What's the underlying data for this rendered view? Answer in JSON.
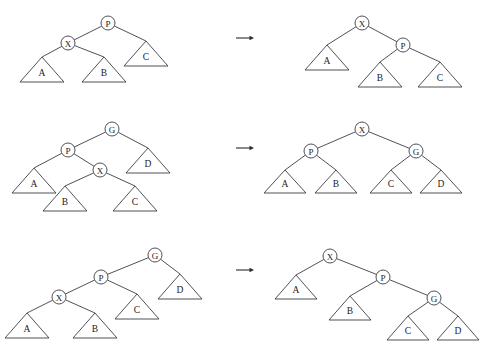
{
  "figure": {
    "width": 485,
    "height": 348,
    "background_color": "#ffffff",
    "stroke_color": "#3d3d46",
    "text_color": "#1c1c22",
    "node_radius": 7,
    "node_labels": [
      "P",
      "X",
      "G",
      "A",
      "B",
      "C",
      "D"
    ],
    "arrow_glyph": "→"
  },
  "rows": [
    {
      "name": "row-1-single-rotation",
      "arrow": {
        "x1": 236,
        "y1": 38,
        "x2": 254,
        "y2": 38,
        "label": "→"
      },
      "before": {
        "name": "row-1-before-tree",
        "nodes": [
          {
            "id": "P",
            "label": "P",
            "cx": 108,
            "cy": 23
          },
          {
            "id": "X",
            "label": "X",
            "cx": 68,
            "cy": 43
          }
        ],
        "triangles": [
          {
            "id": "A",
            "label": "A",
            "apex_x": 42,
            "apex_y": 57,
            "half_width": 22,
            "height": 25
          },
          {
            "id": "B",
            "label": "B",
            "apex_x": 104,
            "apex_y": 57,
            "half_width": 22,
            "height": 25
          },
          {
            "id": "C",
            "label": "C",
            "apex_x": 146,
            "apex_y": 41,
            "half_width": 22,
            "height": 25
          }
        ],
        "edges": [
          {
            "from": "P",
            "to": "X",
            "x1": 108,
            "y1": 23,
            "x2": 68,
            "y2": 43
          },
          {
            "from": "P",
            "to": "C",
            "x1": 108,
            "y1": 23,
            "x2": 146,
            "y2": 41
          },
          {
            "from": "X",
            "to": "A",
            "x1": 68,
            "y1": 43,
            "x2": 42,
            "y2": 57
          },
          {
            "from": "X",
            "to": "B",
            "x1": 68,
            "y1": 43,
            "x2": 104,
            "y2": 57
          }
        ]
      },
      "after": {
        "name": "row-1-after-tree",
        "nodes": [
          {
            "id": "X",
            "label": "X",
            "cx": 362,
            "cy": 23
          },
          {
            "id": "P",
            "label": "P",
            "cx": 403,
            "cy": 45
          }
        ],
        "triangles": [
          {
            "id": "A",
            "label": "A",
            "apex_x": 327,
            "apex_y": 45,
            "half_width": 22,
            "height": 25
          },
          {
            "id": "B",
            "label": "B",
            "apex_x": 380,
            "apex_y": 62,
            "half_width": 22,
            "height": 25
          },
          {
            "id": "C",
            "label": "C",
            "apex_x": 440,
            "apex_y": 62,
            "half_width": 22,
            "height": 25
          }
        ],
        "edges": [
          {
            "from": "X",
            "to": "A",
            "x1": 362,
            "y1": 23,
            "x2": 327,
            "y2": 45
          },
          {
            "from": "X",
            "to": "P",
            "x1": 362,
            "y1": 23,
            "x2": 403,
            "y2": 45
          },
          {
            "from": "P",
            "to": "B",
            "x1": 403,
            "y1": 45,
            "x2": 380,
            "y2": 62
          },
          {
            "from": "P",
            "to": "C",
            "x1": 403,
            "y1": 45,
            "x2": 440,
            "y2": 62
          }
        ]
      }
    },
    {
      "name": "row-2-double-rotation-left-right",
      "arrow": {
        "x1": 236,
        "y1": 148,
        "x2": 254,
        "y2": 148,
        "label": "→"
      },
      "before": {
        "name": "row-2-before-tree",
        "nodes": [
          {
            "id": "G",
            "label": "G",
            "cx": 112,
            "cy": 129
          },
          {
            "id": "P",
            "label": "P",
            "cx": 68,
            "cy": 150
          },
          {
            "id": "X",
            "label": "X",
            "cx": 100,
            "cy": 170
          }
        ],
        "triangles": [
          {
            "id": "A",
            "label": "A",
            "apex_x": 34,
            "apex_y": 168,
            "half_width": 22,
            "height": 25
          },
          {
            "id": "B",
            "label": "B",
            "apex_x": 65,
            "apex_y": 186,
            "half_width": 22,
            "height": 25
          },
          {
            "id": "C",
            "label": "C",
            "apex_x": 135,
            "apex_y": 186,
            "half_width": 22,
            "height": 25
          },
          {
            "id": "D",
            "label": "D",
            "apex_x": 148,
            "apex_y": 148,
            "half_width": 22,
            "height": 25
          }
        ],
        "edges": [
          {
            "from": "G",
            "to": "P",
            "x1": 112,
            "y1": 129,
            "x2": 68,
            "y2": 150
          },
          {
            "from": "G",
            "to": "D",
            "x1": 112,
            "y1": 129,
            "x2": 148,
            "y2": 148
          },
          {
            "from": "P",
            "to": "A",
            "x1": 68,
            "y1": 150,
            "x2": 34,
            "y2": 168
          },
          {
            "from": "P",
            "to": "X",
            "x1": 68,
            "y1": 150,
            "x2": 100,
            "y2": 170
          },
          {
            "from": "X",
            "to": "B",
            "x1": 100,
            "y1": 170,
            "x2": 65,
            "y2": 186
          },
          {
            "from": "X",
            "to": "C",
            "x1": 100,
            "y1": 170,
            "x2": 135,
            "y2": 186
          }
        ]
      },
      "after": {
        "name": "row-2-after-tree",
        "nodes": [
          {
            "id": "X",
            "label": "X",
            "cx": 362,
            "cy": 129
          },
          {
            "id": "P",
            "label": "P",
            "cx": 311,
            "cy": 151
          },
          {
            "id": "G",
            "label": "G",
            "cx": 416,
            "cy": 151
          }
        ],
        "triangles": [
          {
            "id": "A",
            "label": "A",
            "apex_x": 285,
            "apex_y": 170,
            "half_width": 21,
            "height": 23
          },
          {
            "id": "B",
            "label": "B",
            "apex_x": 336,
            "apex_y": 170,
            "half_width": 21,
            "height": 23
          },
          {
            "id": "C",
            "label": "C",
            "apex_x": 391,
            "apex_y": 170,
            "half_width": 21,
            "height": 23
          },
          {
            "id": "D",
            "label": "D",
            "apex_x": 441,
            "apex_y": 170,
            "half_width": 21,
            "height": 23
          }
        ],
        "edges": [
          {
            "from": "X",
            "to": "P",
            "x1": 362,
            "y1": 129,
            "x2": 311,
            "y2": 151
          },
          {
            "from": "X",
            "to": "G",
            "x1": 362,
            "y1": 129,
            "x2": 416,
            "y2": 151
          },
          {
            "from": "P",
            "to": "A",
            "x1": 311,
            "y1": 151,
            "x2": 285,
            "y2": 170
          },
          {
            "from": "P",
            "to": "B",
            "x1": 311,
            "y1": 151,
            "x2": 336,
            "y2": 170
          },
          {
            "from": "G",
            "to": "C",
            "x1": 416,
            "y1": 151,
            "x2": 391,
            "y2": 170
          },
          {
            "from": "G",
            "to": "D",
            "x1": 416,
            "y1": 151,
            "x2": 441,
            "y2": 170
          }
        ]
      }
    },
    {
      "name": "row-3-double-rotation-left-left",
      "arrow": {
        "x1": 236,
        "y1": 270,
        "x2": 254,
        "y2": 270,
        "label": "→"
      },
      "before": {
        "name": "row-3-before-tree",
        "nodes": [
          {
            "id": "G",
            "label": "G",
            "cx": 155,
            "cy": 255
          },
          {
            "id": "P",
            "label": "P",
            "cx": 101,
            "cy": 277
          },
          {
            "id": "X",
            "label": "X",
            "cx": 59,
            "cy": 297
          }
        ],
        "triangles": [
          {
            "id": "A",
            "label": "A",
            "apex_x": 27,
            "apex_y": 313,
            "half_width": 22,
            "height": 25
          },
          {
            "id": "B",
            "label": "B",
            "apex_x": 95,
            "apex_y": 313,
            "half_width": 22,
            "height": 25
          },
          {
            "id": "C",
            "label": "C",
            "apex_x": 137,
            "apex_y": 294,
            "half_width": 22,
            "height": 25
          },
          {
            "id": "D",
            "label": "D",
            "apex_x": 180,
            "apex_y": 274,
            "half_width": 22,
            "height": 25
          }
        ],
        "edges": [
          {
            "from": "G",
            "to": "P",
            "x1": 155,
            "y1": 255,
            "x2": 101,
            "y2": 277
          },
          {
            "from": "G",
            "to": "D",
            "x1": 155,
            "y1": 255,
            "x2": 180,
            "y2": 274
          },
          {
            "from": "P",
            "to": "X",
            "x1": 101,
            "y1": 277,
            "x2": 59,
            "y2": 297
          },
          {
            "from": "P",
            "to": "C",
            "x1": 101,
            "y1": 277,
            "x2": 137,
            "y2": 294
          },
          {
            "from": "X",
            "to": "A",
            "x1": 59,
            "y1": 297,
            "x2": 27,
            "y2": 313
          },
          {
            "from": "X",
            "to": "B",
            "x1": 59,
            "y1": 297,
            "x2": 95,
            "y2": 313
          }
        ]
      },
      "after": {
        "name": "row-3-after-tree",
        "nodes": [
          {
            "id": "X",
            "label": "X",
            "cx": 330,
            "cy": 256
          },
          {
            "id": "P",
            "label": "P",
            "cx": 383,
            "cy": 277
          },
          {
            "id": "G",
            "label": "G",
            "cx": 434,
            "cy": 298
          }
        ],
        "triangles": [
          {
            "id": "A",
            "label": "A",
            "apex_x": 296,
            "apex_y": 275,
            "half_width": 21,
            "height": 24
          },
          {
            "id": "B",
            "label": "B",
            "apex_x": 350,
            "apex_y": 296,
            "half_width": 21,
            "height": 24
          },
          {
            "id": "C",
            "label": "C",
            "apex_x": 408,
            "apex_y": 316,
            "half_width": 21,
            "height": 24
          },
          {
            "id": "D",
            "label": "D",
            "apex_x": 458,
            "apex_y": 316,
            "half_width": 21,
            "height": 24
          }
        ],
        "edges": [
          {
            "from": "X",
            "to": "A",
            "x1": 330,
            "y1": 256,
            "x2": 296,
            "y2": 275
          },
          {
            "from": "X",
            "to": "P",
            "x1": 330,
            "y1": 256,
            "x2": 383,
            "y2": 277
          },
          {
            "from": "P",
            "to": "B",
            "x1": 383,
            "y1": 277,
            "x2": 350,
            "y2": 296
          },
          {
            "from": "P",
            "to": "G",
            "x1": 383,
            "y1": 277,
            "x2": 434,
            "y2": 298
          },
          {
            "from": "G",
            "to": "C",
            "x1": 434,
            "y1": 298,
            "x2": 408,
            "y2": 316
          },
          {
            "from": "G",
            "to": "D",
            "x1": 434,
            "y1": 298,
            "x2": 458,
            "y2": 316
          }
        ]
      }
    }
  ]
}
